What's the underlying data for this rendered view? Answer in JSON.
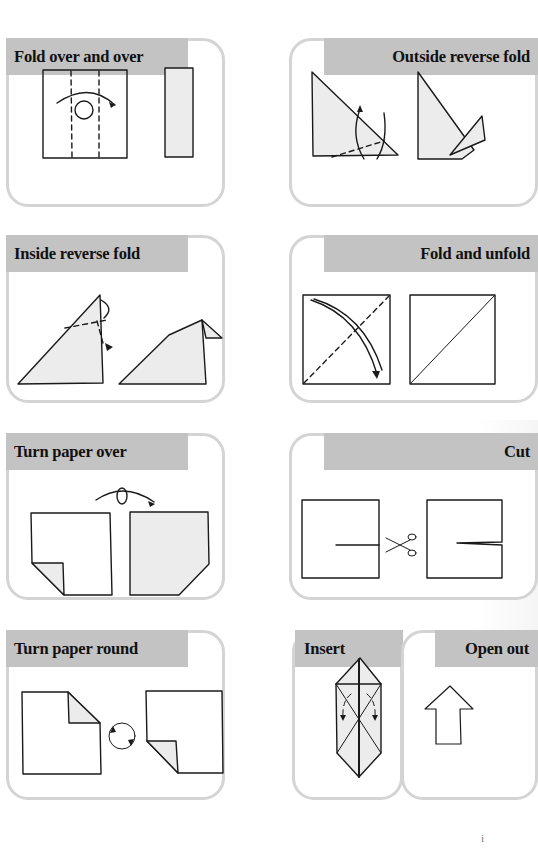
{
  "panels": [
    {
      "id": "fold-over-and-over",
      "title": "Fold over and over"
    },
    {
      "id": "outside-reverse-fold",
      "title": "Outside reverse fold"
    },
    {
      "id": "inside-reverse-fold",
      "title": "Inside reverse fold"
    },
    {
      "id": "fold-and-unfold",
      "title": "Fold and unfold"
    },
    {
      "id": "turn-paper-over",
      "title": "Turn paper over"
    },
    {
      "id": "cut",
      "title": "Cut"
    },
    {
      "id": "turn-paper-round",
      "title": "Turn paper round"
    },
    {
      "id": "insert",
      "title": "Insert"
    },
    {
      "id": "open-out",
      "title": "Open out"
    }
  ],
  "page_number": "i",
  "colors": {
    "header_bg": "#c3c3c3",
    "panel_border": "#d4d4d4",
    "paper_fill": "#ececec"
  }
}
